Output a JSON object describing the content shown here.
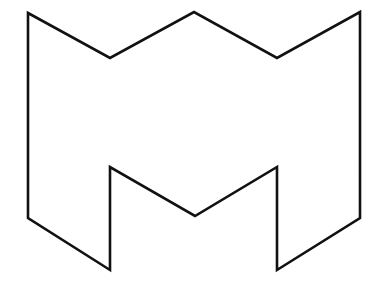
{
  "canvas": {
    "width": 381,
    "height": 289,
    "background_color": "#ffffff"
  },
  "figure": {
    "name": "m-shape-outline",
    "stroke_color": "#111111",
    "stroke_width": 2.6,
    "fill_color": "none",
    "stroke_linejoin": "miter",
    "points": "28,13 110,58 194,12 277,58 360,12 360,218 277,270 277,167 195,216 110,167 110,270 28,218",
    "vertices": [
      {
        "label": "top-left-corner",
        "x": 28,
        "y": 13
      },
      {
        "label": "left-valley",
        "x": 110,
        "y": 58
      },
      {
        "label": "center-peak",
        "x": 194,
        "y": 12
      },
      {
        "label": "right-valley",
        "x": 277,
        "y": 58
      },
      {
        "label": "top-right-corner",
        "x": 360,
        "y": 12
      },
      {
        "label": "right-side-bend",
        "x": 360,
        "y": 218
      },
      {
        "label": "bottom-right-foot",
        "x": 277,
        "y": 270
      },
      {
        "label": "inner-notch-top-right",
        "x": 277,
        "y": 167
      },
      {
        "label": "inner-v-bottom",
        "x": 195,
        "y": 216
      },
      {
        "label": "inner-notch-top-left",
        "x": 110,
        "y": 167
      },
      {
        "label": "bottom-left-foot",
        "x": 110,
        "y": 270
      },
      {
        "label": "left-side-bend",
        "x": 28,
        "y": 218
      }
    ]
  }
}
